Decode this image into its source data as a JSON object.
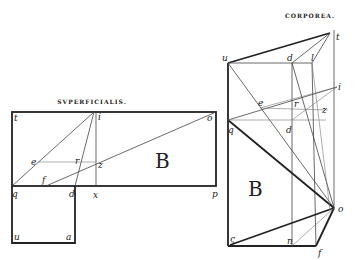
{
  "figures": {
    "superficialis": {
      "title": "SVPERFICIALIS.",
      "region_label": "B",
      "points": {
        "t": "t",
        "i": "i",
        "o": "o",
        "e": "e",
        "r": "r",
        "z": "z",
        "f": "f",
        "q": "q",
        "d": "d",
        "x": "x",
        "p": "p",
        "u": "u",
        "a": "a"
      }
    },
    "corporea": {
      "title": "CORPOREA.",
      "region_label": "B",
      "points": {
        "t": "t",
        "u": "u",
        "d_top": "d",
        "l": "l",
        "i": "i",
        "e": "e",
        "r": "r",
        "z": "z",
        "q": "q",
        "d_mid": "d",
        "o": "o",
        "s": "ς",
        "n": "n",
        "f": "f"
      }
    }
  }
}
